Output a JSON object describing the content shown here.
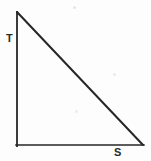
{
  "figure": {
    "type": "geometry-diagram",
    "background_color": "#fdfdfd",
    "stroke_color": "#262626",
    "width": 151,
    "height": 161
  },
  "labels": {
    "apex": "T",
    "base_right": "S"
  },
  "chart_data": {
    "type": "diagram",
    "shape": "right-triangle",
    "stroke_color": "#262626",
    "background": "#fdfdfd",
    "vertices": [
      {
        "name": "T",
        "label": "T",
        "x": 17,
        "y": 12,
        "label_x": 6,
        "label_y": 33
      },
      {
        "name": "right-angle-corner",
        "label": "",
        "x": 17,
        "y": 145,
        "label_x": null,
        "label_y": null
      },
      {
        "name": "S",
        "label": "S",
        "x": 143,
        "y": 145,
        "label_x": 114,
        "label_y": 147
      }
    ],
    "edges": [
      {
        "name": "vertical-leg",
        "from": "T",
        "to": "right-angle-corner",
        "x1": 17,
        "y1": 12,
        "x2": 17,
        "y2": 146,
        "stroke_width": 1.8
      },
      {
        "name": "horizontal-leg",
        "from": "right-angle-corner",
        "to": "S",
        "x1": 16,
        "y1": 145,
        "x2": 144,
        "y2": 145,
        "stroke_width": 1.5
      },
      {
        "name": "hypotenuse",
        "from": "T",
        "to": "S",
        "x1": 17,
        "y1": 12,
        "x2": 143,
        "y2": 145,
        "stroke_width": 2.0
      }
    ],
    "artifacts": [
      {
        "name": "scan-speck-1",
        "x": 73,
        "y": 6,
        "size": 3,
        "color": "#e6e6e8"
      },
      {
        "name": "scan-speck-2",
        "x": 113,
        "y": 73,
        "size": 3,
        "color": "#ececee"
      },
      {
        "name": "scan-speck-3",
        "x": 75,
        "y": 110,
        "size": 3,
        "color": "#ececee"
      }
    ]
  }
}
